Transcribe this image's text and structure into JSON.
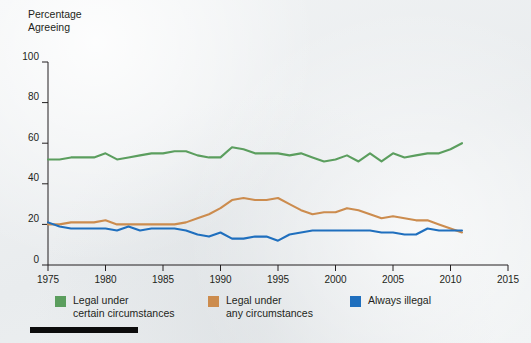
{
  "axis_title": "Percentage\nAgreeing",
  "legend": {
    "items": [
      {
        "label": "Legal under\ncertain circumstances",
        "color": "#5b9e5e",
        "name": "legal-certain-circumstances"
      },
      {
        "label": "Legal under\nany circumstances",
        "color": "#cc8c4e",
        "name": "legal-any-circumstances"
      },
      {
        "label": "Always illegal",
        "color": "#1f6fbe",
        "name": "always-illegal"
      }
    ]
  },
  "chart_data": {
    "type": "line",
    "title": "",
    "subtitle": "",
    "xlabel": "",
    "ylabel": "Percentage Agreeing",
    "xlim": [
      1975,
      2015
    ],
    "ylim": [
      0,
      100
    ],
    "xticks": [
      1975,
      1980,
      1985,
      1990,
      1995,
      2000,
      2005,
      2010,
      2015
    ],
    "yticks": [
      0,
      20,
      40,
      60,
      80,
      100
    ],
    "grid": false,
    "legend_position": "below",
    "x": [
      1975,
      1976,
      1977,
      1978,
      1979,
      1980,
      1981,
      1982,
      1983,
      1984,
      1985,
      1986,
      1987,
      1988,
      1989,
      1990,
      1991,
      1992,
      1993,
      1994,
      1995,
      1996,
      1997,
      1998,
      1999,
      2000,
      2001,
      2002,
      2003,
      2004,
      2005,
      2006,
      2007,
      2008,
      2009,
      2010,
      2011
    ],
    "series": [
      {
        "name": "Legal under certain circumstances",
        "color": "#5b9e5e",
        "values": [
          52,
          52,
          53,
          53,
          53,
          55,
          52,
          53,
          54,
          55,
          55,
          56,
          56,
          54,
          53,
          53,
          58,
          57,
          55,
          55,
          55,
          54,
          55,
          53,
          51,
          52,
          54,
          51,
          55,
          51,
          55,
          53,
          54,
          55,
          55,
          57,
          60
        ]
      },
      {
        "name": "Legal under any circumstances",
        "color": "#cc8c4e",
        "values": [
          20,
          20,
          21,
          21,
          21,
          22,
          20,
          20,
          20,
          20,
          20,
          20,
          21,
          23,
          25,
          28,
          32,
          33,
          32,
          32,
          33,
          30,
          27,
          25,
          26,
          26,
          28,
          27,
          25,
          23,
          24,
          23,
          22,
          22,
          20,
          18,
          16
        ]
      },
      {
        "name": "Always illegal",
        "color": "#1f6fbe",
        "values": [
          21,
          19,
          18,
          18,
          18,
          18,
          17,
          19,
          17,
          18,
          18,
          18,
          17,
          15,
          14,
          16,
          13,
          13,
          14,
          14,
          12,
          15,
          16,
          17,
          17,
          17,
          17,
          17,
          17,
          16,
          16,
          15,
          15,
          18,
          17,
          17,
          17
        ]
      }
    ]
  }
}
